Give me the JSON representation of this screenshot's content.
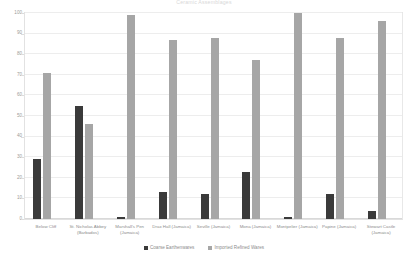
{
  "chart_data": {
    "type": "bar",
    "title": "Ceramic Assemblages",
    "xlabel": "",
    "ylabel": "",
    "ylim": [
      0,
      100
    ],
    "yticks": [
      0,
      10,
      20,
      30,
      40,
      50,
      60,
      70,
      80,
      90,
      100
    ],
    "grid": true,
    "legend_position": "bottom",
    "categories": [
      "Below Cliff",
      "St. Nicholas Abbey (Barbados)",
      "Marshall's Pen (Jamaica)",
      "Drax Hall (Jamaica)",
      "Seville (Jamaica)",
      "Mona (Jamaica)",
      "Montpelier (Jamaica)",
      "Papine (Jamaica)",
      "Stewart Castle (Jamaica)"
    ],
    "series": [
      {
        "name": "Coarse Earthenwares",
        "color": "#3a3a3a",
        "values": [
          29,
          55,
          1,
          13,
          12,
          23,
          1,
          12,
          4
        ]
      },
      {
        "name": "Imported Refined Wares",
        "color": "#a6a6a6",
        "values": [
          71,
          46,
          99,
          87,
          88,
          77,
          100,
          88,
          96
        ]
      }
    ]
  }
}
